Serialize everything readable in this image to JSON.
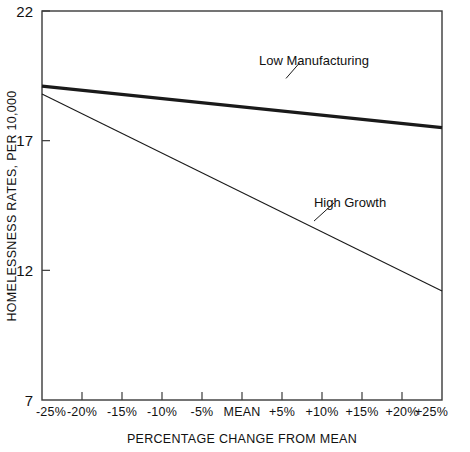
{
  "chart_data": {
    "type": "line",
    "title": "",
    "xlabel": "PERCENTAGE CHANGE FROM MEAN",
    "ylabel": "HOMELESSNESS RATES, PER 10,000",
    "x": [
      -25,
      -20,
      -15,
      -10,
      -5,
      0,
      5,
      10,
      15,
      20,
      25
    ],
    "xticklabels": [
      "-25%",
      "-20%",
      "-15%",
      "-10%",
      "-5%",
      "MEAN",
      "+5%",
      "+10%",
      "+15%",
      "+20%",
      "+25%"
    ],
    "yticks": [
      7,
      12,
      17,
      22
    ],
    "yticklabels": [
      "7",
      "12",
      "17",
      "22"
    ],
    "xlim": [
      -25,
      25
    ],
    "ylim": [
      7,
      22
    ],
    "grid": false,
    "legend_position": "inline-annotation",
    "series": [
      {
        "name": "Low Manufacturing",
        "label": "Low Manufacturing",
        "style": "thick-solid",
        "x": [
          -25,
          25
        ],
        "values": [
          19.1,
          17.5
        ],
        "label_x": 9,
        "label_y": 20.1,
        "leader_from_x": 5.5,
        "leader_from_y": 19.4,
        "leader_to_x": 7.2,
        "leader_to_y": 20.0
      },
      {
        "name": "High Growth",
        "label": "High Growth",
        "style": "thin-solid",
        "x": [
          -25,
          25
        ],
        "values": [
          18.8,
          11.2
        ],
        "label_x": 13.5,
        "label_y": 14.6,
        "leader_from_x": 9.0,
        "leader_from_y": 13.9,
        "leader_to_x": 11.5,
        "leader_to_y": 14.6
      }
    ]
  },
  "axes": {
    "y_title": "HOMELESSNESS RATES, PER 10,000",
    "x_title": "PERCENTAGE CHANGE FROM MEAN"
  }
}
